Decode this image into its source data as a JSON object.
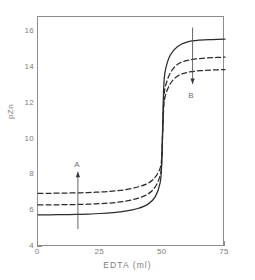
{
  "chart_data": {
    "type": "line",
    "title": "",
    "xlabel": "EDTA (ml)",
    "ylabel": "pZn",
    "xlim": [
      0,
      75
    ],
    "ylim": [
      4,
      16.84
    ],
    "grid": false,
    "legend": "none",
    "x_ticks": [
      0,
      25,
      50,
      75
    ],
    "x_tick_labels": [
      "0",
      "25",
      "50",
      "75"
    ],
    "y_ticks": [
      4,
      6,
      8,
      10,
      12,
      14,
      16
    ],
    "y_tick_labels": [
      "4",
      "6",
      "8",
      "10",
      "12",
      "14",
      "16"
    ],
    "y_minor_ticks": [
      5,
      7,
      9,
      11,
      13,
      15
    ],
    "equivalence_point_ml": 50,
    "series": [
      {
        "name": "solid-curve",
        "style": "solid",
        "color": "#2b2b2b",
        "initial_pzn": 5.8,
        "final_pzn": 15.6,
        "x": [
          0,
          5,
          10,
          15,
          20,
          25,
          30,
          35,
          40,
          44,
          47,
          49,
          49.6,
          50,
          50.4,
          51,
          53,
          56,
          60,
          65,
          70,
          75
        ],
        "y": [
          5.8,
          5.8,
          5.81,
          5.82,
          5.84,
          5.87,
          5.92,
          6.0,
          6.15,
          6.38,
          6.8,
          7.6,
          8.6,
          10.7,
          12.8,
          13.8,
          14.7,
          15.2,
          15.45,
          15.55,
          15.58,
          15.6
        ]
      },
      {
        "name": "dashed-curve-middle",
        "style": "dashed",
        "color": "#2b2b2b",
        "initial_pzn": 6.35,
        "final_pzn": 14.6,
        "x": [
          0,
          5,
          10,
          15,
          20,
          25,
          30,
          35,
          40,
          44,
          47,
          49,
          49.6,
          50,
          50.4,
          51,
          53,
          56,
          60,
          65,
          70,
          75
        ],
        "y": [
          6.35,
          6.35,
          6.36,
          6.37,
          6.39,
          6.42,
          6.47,
          6.56,
          6.72,
          6.95,
          7.35,
          8.0,
          8.7,
          10.4,
          12.1,
          12.9,
          13.7,
          14.2,
          14.42,
          14.52,
          14.57,
          14.6
        ]
      },
      {
        "name": "dashed-curve-outer",
        "style": "dashed",
        "color": "#2b2b2b",
        "initial_pzn": 7.0,
        "final_pzn": 13.9,
        "x": [
          0,
          5,
          10,
          15,
          20,
          25,
          30,
          35,
          40,
          44,
          47,
          49,
          49.6,
          50,
          50.4,
          51,
          53,
          56,
          60,
          65,
          70,
          75
        ],
        "y": [
          7.0,
          7.0,
          7.01,
          7.02,
          7.04,
          7.07,
          7.12,
          7.2,
          7.35,
          7.55,
          7.9,
          8.4,
          9.0,
          10.35,
          11.7,
          12.4,
          13.1,
          13.55,
          13.75,
          13.84,
          13.88,
          13.9
        ]
      }
    ],
    "annotations": [
      {
        "label": "A",
        "direction": "up",
        "x_ml": 16,
        "y_from_pzn": 5.0,
        "y_to_pzn": 8.2,
        "label_position": "above"
      },
      {
        "label": "B",
        "direction": "down",
        "x_ml": 62,
        "y_from_pzn": 16.25,
        "y_to_pzn": 13.1,
        "label_position": "below"
      }
    ]
  },
  "axes": {
    "x_title": "EDTA (ml)",
    "y_title": "pZn"
  },
  "colors": {
    "curve": "#2b2b2b",
    "frame": "#8d8d8d",
    "text": "#7d7d7d",
    "background": "#ffffff"
  }
}
